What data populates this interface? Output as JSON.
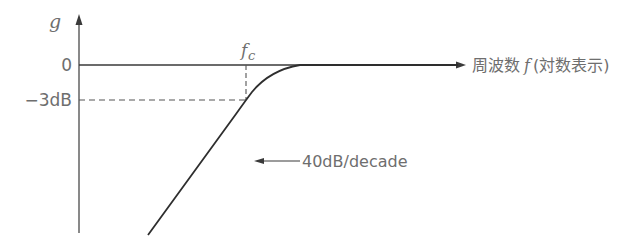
{
  "diagram": {
    "type": "bode-magnitude-highpass",
    "y_axis": {
      "label": "g"
    },
    "x_axis": {
      "label_prefix": "周波数",
      "label_var": "f",
      "label_suffix": "(対数表示)"
    },
    "ticks": {
      "zero": "0",
      "minus3db": "−3dB"
    },
    "cutoff_label": {
      "var": "f",
      "sub": "c"
    },
    "slope_annotation": "40dB/decade",
    "colors": {
      "line": "#3a3a3a",
      "text": "#6e6e6e",
      "dashed": "#555555"
    }
  }
}
